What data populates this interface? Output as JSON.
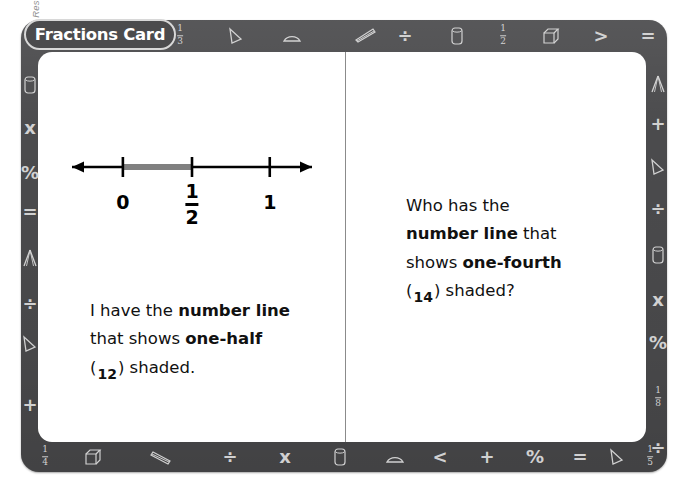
{
  "copyright": "Ask & Answer Interactive Math Practice: Grades 4-6 © 2007 by Joseph A. Porzio, Scholastic Teaching Resources",
  "card": {
    "title": "Fractions Card",
    "frame_color": "#4b4b4d",
    "card_color": "#ffffff",
    "icon_color": "#dddddd"
  },
  "number_line": {
    "ticks": [
      {
        "label": "0",
        "type": "plain",
        "pos": 18
      },
      {
        "label": "1/2",
        "type": "fraction",
        "numerator": "1",
        "denominator": "2",
        "pos": 50
      },
      {
        "label": "1",
        "type": "plain",
        "pos": 86
      }
    ],
    "shaded_from": 18,
    "shaded_to": 50,
    "shaded_color": "#808080"
  },
  "left_panel": {
    "line1_a": "I have the ",
    "line1_b": "number line",
    "line2_a": "that shows ",
    "line2_b": "one-half",
    "line3_open": "(",
    "line3_num": "1",
    "line3_den": "2",
    "line3_close": ") shaded."
  },
  "right_panel": {
    "line1": "Who has the",
    "line2_a": "number line",
    "line2_b": " that",
    "line3_a": "shows ",
    "line3_b": "one-fourth",
    "line4_open": "(",
    "line4_num": "1",
    "line4_den": "4",
    "line4_close": ") shaded?"
  },
  "border_icons": {
    "top": [
      {
        "name": "fraction-one-third-icon",
        "glyph": "frac",
        "num": "1",
        "den": "3",
        "x": 180
      },
      {
        "name": "triangle-icon",
        "glyph": "triangle",
        "x": 236
      },
      {
        "name": "protractor-icon",
        "glyph": "protractor",
        "x": 292
      },
      {
        "name": "ruler-icon",
        "glyph": "ruler",
        "x": 366
      },
      {
        "name": "divide-icon",
        "glyph": "÷",
        "x": 405
      },
      {
        "name": "cylinder-icon",
        "glyph": "cylinder",
        "x": 457
      },
      {
        "name": "fraction-one-half-icon",
        "glyph": "frac",
        "num": "1",
        "den": "2",
        "x": 503
      },
      {
        "name": "cube-icon",
        "glyph": "cube",
        "x": 551
      },
      {
        "name": "greater-than-icon",
        "glyph": ">",
        "x": 601
      },
      {
        "name": "equals-icon",
        "glyph": "=",
        "x": 648
      }
    ],
    "bottom": [
      {
        "name": "fraction-one-fourth-icon",
        "glyph": "frac",
        "num": "1",
        "den": "4",
        "x": 45
      },
      {
        "name": "cube-icon",
        "glyph": "cube",
        "x": 93
      },
      {
        "name": "ruler-icon",
        "glyph": "ruler-left",
        "x": 160
      },
      {
        "name": "divide-icon",
        "glyph": "÷",
        "x": 230
      },
      {
        "name": "multiply-icon",
        "glyph": "x",
        "x": 285
      },
      {
        "name": "cylinder-icon",
        "glyph": "cylinder",
        "x": 340
      },
      {
        "name": "protractor-icon",
        "glyph": "protractor",
        "x": 395
      },
      {
        "name": "less-than-icon",
        "glyph": "<",
        "x": 440
      },
      {
        "name": "plus-icon",
        "glyph": "+",
        "x": 487
      },
      {
        "name": "percent-icon",
        "glyph": "%",
        "x": 535
      },
      {
        "name": "equals-icon",
        "glyph": "=",
        "x": 580
      },
      {
        "name": "triangle-icon",
        "glyph": "triangle",
        "x": 617
      },
      {
        "name": "fraction-one-fifth-icon",
        "glyph": "frac",
        "num": "1",
        "den": "5",
        "x": 650
      }
    ],
    "left": [
      {
        "name": "cylinder-icon",
        "glyph": "cylinder",
        "y": 85
      },
      {
        "name": "multiply-icon",
        "glyph": "x",
        "y": 128
      },
      {
        "name": "percent-icon",
        "glyph": "%",
        "y": 173
      },
      {
        "name": "equals-icon",
        "glyph": "=",
        "y": 212
      },
      {
        "name": "compass-icon",
        "glyph": "compass",
        "y": 258
      },
      {
        "name": "divide-icon",
        "glyph": "÷",
        "y": 304
      },
      {
        "name": "triangle-icon",
        "glyph": "triangle",
        "y": 344
      },
      {
        "name": "plus-icon",
        "glyph": "+",
        "y": 405
      }
    ],
    "right": [
      {
        "name": "compass-icon",
        "glyph": "compass",
        "y": 84
      },
      {
        "name": "plus-icon",
        "glyph": "+",
        "y": 124
      },
      {
        "name": "triangle-icon",
        "glyph": "triangle",
        "y": 167
      },
      {
        "name": "divide-icon",
        "glyph": "÷",
        "y": 209
      },
      {
        "name": "cylinder-icon",
        "glyph": "cylinder",
        "y": 255
      },
      {
        "name": "multiply-icon",
        "glyph": "x",
        "y": 300
      },
      {
        "name": "percent-icon",
        "glyph": "%",
        "y": 343
      },
      {
        "name": "fraction-one-eighth-icon",
        "glyph": "frac",
        "num": "1",
        "den": "8",
        "y": 398
      },
      {
        "name": "divide-icon",
        "glyph": "÷",
        "y": 448
      }
    ]
  }
}
